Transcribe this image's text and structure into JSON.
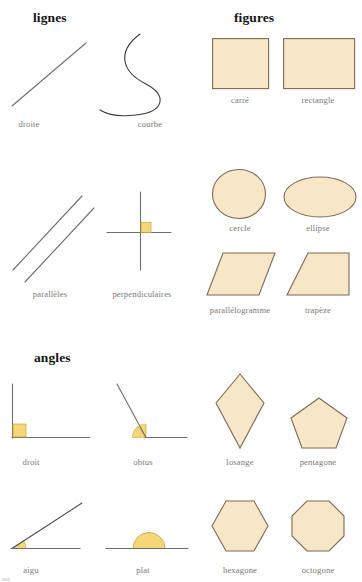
{
  "page": {
    "width": 362,
    "height": 582,
    "background": "#ffffff"
  },
  "palette": {
    "shape_fill": "#f7e6c8",
    "shape_stroke": "#7d6a55",
    "line_stroke": "#6e6e6e",
    "curve_stroke": "#3b3b3b",
    "angle_marker_fill": "#f5d77a",
    "angle_marker_stroke": "#c9a43a",
    "caption_color": "#7b7876",
    "heading_color": "#141414"
  },
  "sections": [
    {
      "id": "lignes",
      "label": "lignes",
      "x": 33,
      "y": 18
    },
    {
      "id": "figures",
      "label": "figures",
      "x": 258,
      "y": 18
    },
    {
      "id": "angles",
      "label": "angles",
      "x": 34,
      "y": 358
    }
  ],
  "figures": [
    {
      "id": "droite",
      "label": "droite",
      "type": "line",
      "section": "lignes",
      "caption_x": 29,
      "caption_y": 124
    },
    {
      "id": "courbe",
      "label": "courbe",
      "type": "curve",
      "section": "lignes",
      "caption_x": 150,
      "caption_y": 124
    },
    {
      "id": "carre",
      "label": "carré",
      "type": "square",
      "section": "figures",
      "caption_x": 240,
      "caption_y": 100
    },
    {
      "id": "rectangle",
      "label": "rectangle",
      "type": "rectangle",
      "section": "figures",
      "caption_x": 318,
      "caption_y": 100
    },
    {
      "id": "paralleles",
      "label": "parallèles",
      "type": "parallel-lines",
      "section": "lignes",
      "caption_x": 50,
      "caption_y": 294
    },
    {
      "id": "perpendiculaires",
      "label": "perpendiculaires",
      "type": "perpendicular-lines",
      "section": "lignes",
      "caption_x": 142,
      "caption_y": 294
    },
    {
      "id": "cercle",
      "label": "cercle",
      "type": "circle",
      "section": "figures",
      "caption_x": 240,
      "caption_y": 228
    },
    {
      "id": "ellipse",
      "label": "ellipse",
      "type": "ellipse",
      "section": "figures",
      "caption_x": 318,
      "caption_y": 228
    },
    {
      "id": "parallelogramme",
      "label": "parallélogramme",
      "type": "parallelogram",
      "section": "figures",
      "caption_x": 240,
      "caption_y": 310
    },
    {
      "id": "trapeze",
      "label": "trapèze",
      "type": "trapezoid",
      "section": "figures",
      "caption_x": 318,
      "caption_y": 310
    },
    {
      "id": "droit",
      "label": "droit",
      "type": "right-angle",
      "section": "angles",
      "angle_degrees": 90,
      "caption_x": 31,
      "caption_y": 462
    },
    {
      "id": "obtus",
      "label": "obtus",
      "type": "obtuse-angle",
      "section": "angles",
      "angle_degrees": 125,
      "caption_x": 143,
      "caption_y": 462
    },
    {
      "id": "losange",
      "label": "losange",
      "type": "rhombus",
      "section": "figures",
      "caption_x": 240,
      "caption_y": 462
    },
    {
      "id": "pentagone",
      "label": "pentagone",
      "type": "pentagon",
      "section": "figures",
      "sides": 5,
      "caption_x": 318,
      "caption_y": 462
    },
    {
      "id": "aigu",
      "label": "aigu",
      "type": "acute-angle",
      "section": "angles",
      "angle_degrees": 33,
      "caption_x": 31,
      "caption_y": 570
    },
    {
      "id": "plat",
      "label": "plat",
      "type": "straight-angle",
      "section": "angles",
      "angle_degrees": 180,
      "caption_x": 143,
      "caption_y": 570
    },
    {
      "id": "hexagone",
      "label": "hexagone",
      "type": "hexagon",
      "section": "figures",
      "sides": 6,
      "caption_x": 240,
      "caption_y": 570
    },
    {
      "id": "octogone",
      "label": "octogone",
      "type": "octagon",
      "section": "figures",
      "sides": 8,
      "caption_x": 318,
      "caption_y": 570
    }
  ]
}
